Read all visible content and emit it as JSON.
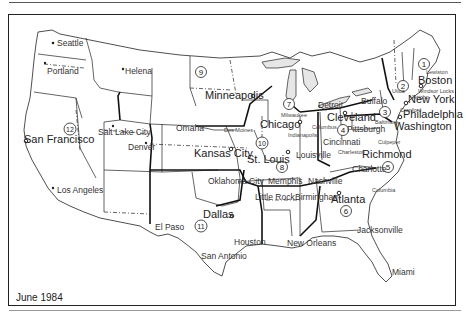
{
  "map": {
    "caption": "June 1984",
    "colors": {
      "ink": "#222222",
      "background": "#ffffff",
      "lakes": "#e6e6e6"
    },
    "regions": [
      {
        "number": "1",
        "x": 424,
        "y": 64
      },
      {
        "number": "2",
        "x": 403,
        "y": 86
      },
      {
        "number": "3",
        "x": 385,
        "y": 112
      },
      {
        "number": "4",
        "x": 343,
        "y": 130
      },
      {
        "number": "5",
        "x": 388,
        "y": 167
      },
      {
        "number": "6",
        "x": 346,
        "y": 211
      },
      {
        "number": "7",
        "x": 289,
        "y": 104
      },
      {
        "number": "8",
        "x": 282,
        "y": 167
      },
      {
        "number": "9",
        "x": 201,
        "y": 72
      },
      {
        "number": "10",
        "x": 262,
        "y": 143
      },
      {
        "number": "11",
        "x": 201,
        "y": 226
      },
      {
        "number": "12",
        "x": 70,
        "y": 129
      }
    ],
    "headquarters_cities": [
      {
        "name": "Seattle",
        "x": 57,
        "y": 43,
        "size": "md"
      },
      {
        "name": "San Francisco",
        "x": 26,
        "y": 138,
        "size": "lg"
      },
      {
        "name": "Minneapolis",
        "x": 205,
        "y": 99,
        "size": "lg"
      },
      {
        "name": "Chicago",
        "x": 269,
        "y": 128,
        "size": "lg"
      },
      {
        "name": "Detroit",
        "x": 314,
        "y": 108,
        "size": "md"
      },
      {
        "name": "Cleveland",
        "x": 327,
        "y": 120,
        "size": "lg"
      },
      {
        "name": "Pittsburgh",
        "x": 343,
        "y": 131,
        "size": "md"
      },
      {
        "name": "Cincinnati",
        "x": 323,
        "y": 142,
        "size": "md"
      },
      {
        "name": "Buffalo",
        "x": 360,
        "y": 103,
        "size": "md"
      },
      {
        "name": "Boston",
        "x": 418,
        "y": 83,
        "size": "lg"
      },
      {
        "name": "New York",
        "x": 404,
        "y": 102,
        "size": "lg"
      },
      {
        "name": "Philadelphia",
        "x": 402,
        "y": 116,
        "size": "lg"
      },
      {
        "name": "Washington",
        "x": 393,
        "y": 128,
        "size": "lg"
      },
      {
        "name": "Richmond",
        "x": 362,
        "y": 156,
        "size": "lg"
      },
      {
        "name": "Charlotte",
        "x": 351,
        "y": 171,
        "size": "md"
      },
      {
        "name": "Atlanta",
        "x": 331,
        "y": 203,
        "size": "lg"
      },
      {
        "name": "Birmingham",
        "x": 295,
        "y": 200,
        "size": "md"
      },
      {
        "name": "Nashville",
        "x": 307,
        "y": 184,
        "size": "md"
      },
      {
        "name": "Memphis",
        "x": 267,
        "y": 184,
        "size": "md"
      },
      {
        "name": "Louisville",
        "x": 295,
        "y": 157,
        "size": "md"
      },
      {
        "name": "St. Louis",
        "x": 247,
        "y": 162,
        "size": "lg"
      },
      {
        "name": "Kansas City",
        "x": 194,
        "y": 156,
        "size": "lg"
      },
      {
        "name": "Omaha",
        "x": 176,
        "y": 130,
        "size": "md"
      },
      {
        "name": "Denver",
        "x": 130,
        "y": 149,
        "size": "md"
      },
      {
        "name": "Salt Lake City",
        "x": 90,
        "y": 136,
        "size": "md"
      },
      {
        "name": "Los Angeles",
        "x": 55,
        "y": 192,
        "size": "md"
      },
      {
        "name": "Dallas",
        "x": 205,
        "y": 217,
        "size": "lg"
      },
      {
        "name": "Houston",
        "x": 234,
        "y": 245,
        "size": "md"
      },
      {
        "name": "San Antonio",
        "x": 201,
        "y": 258,
        "size": "md"
      },
      {
        "name": "El Paso",
        "x": 153,
        "y": 229,
        "size": "md"
      },
      {
        "name": "Oklahoma City",
        "x": 208,
        "y": 183,
        "size": "md"
      },
      {
        "name": "Little Rock",
        "x": 258,
        "y": 198,
        "size": "md"
      },
      {
        "name": "New Orleans",
        "x": 287,
        "y": 244,
        "size": "md"
      },
      {
        "name": "Jacksonville",
        "x": 363,
        "y": 231,
        "size": "md"
      },
      {
        "name": "Miami",
        "x": 391,
        "y": 273,
        "size": "md"
      },
      {
        "name": "Portland",
        "x": 46,
        "y": 74,
        "size": "md"
      },
      {
        "name": "Helena",
        "x": 125,
        "y": 73,
        "size": "md"
      }
    ],
    "minor_cities": [
      {
        "name": "Lewiston",
        "x": 426,
        "y": 73
      },
      {
        "name": "Windsor Locks",
        "x": 418,
        "y": 92
      },
      {
        "name": "Utica",
        "x": 392,
        "y": 92
      },
      {
        "name": "Jericho",
        "x": 411,
        "y": 98
      },
      {
        "name": "Cranford",
        "x": 400,
        "y": 111
      },
      {
        "name": "Baltimore",
        "x": 386,
        "y": 123
      },
      {
        "name": "Culpeper",
        "x": 378,
        "y": 143
      },
      {
        "name": "Charleston",
        "x": 350,
        "y": 152
      },
      {
        "name": "Columbus",
        "x": 318,
        "y": 128
      },
      {
        "name": "Milwaukee",
        "x": 284,
        "y": 116
      },
      {
        "name": "Indianapolis",
        "x": 297,
        "y": 137
      },
      {
        "name": "Des Moines",
        "x": 226,
        "y": 131
      },
      {
        "name": "Columbia",
        "x": 372,
        "y": 191
      }
    ]
  }
}
